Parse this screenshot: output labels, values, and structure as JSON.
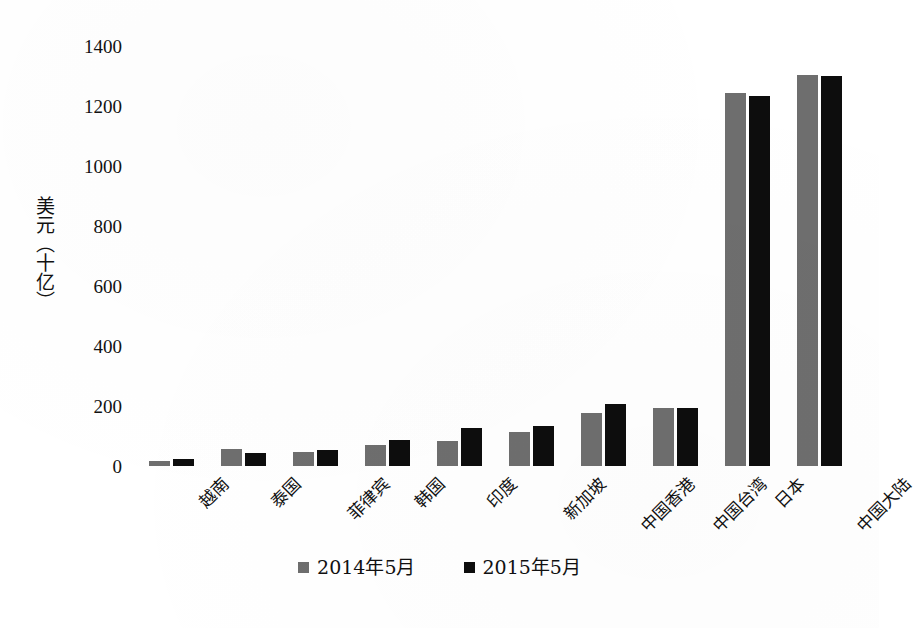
{
  "chart_data": {
    "type": "bar",
    "title": "",
    "subtitle": "",
    "xlabel": "",
    "ylabel": "美元（十亿）",
    "ylim": [
      0,
      1400
    ],
    "ytick_labels": [
      "1400",
      "1200",
      "1000",
      "800",
      "600",
      "400",
      "200",
      "0"
    ],
    "ytick_values": [
      1400,
      1200,
      1000,
      800,
      600,
      400,
      200,
      0
    ],
    "grid": false,
    "legend_position": "bottom",
    "categories": [
      "越南",
      "泰国",
      "菲律宾",
      "韩国",
      "印度",
      "新加坡",
      "中国香港",
      "中国台湾",
      "日本",
      "中国大陆"
    ],
    "series": [
      {
        "name": "2014年5月",
        "color": "#6e6e6e",
        "values": [
          18,
          58,
          48,
          70,
          85,
          115,
          178,
          195,
          1245,
          1305
        ]
      },
      {
        "name": "2015年5月",
        "color": "#0d0d0d",
        "values": [
          22,
          42,
          55,
          88,
          128,
          135,
          207,
          193,
          1235,
          1300
        ]
      }
    ]
  },
  "legend": {
    "items": [
      {
        "label": "2014年5月",
        "color": "#6e6e6e"
      },
      {
        "label": "2015年5月",
        "color": "#0d0d0d"
      }
    ]
  }
}
